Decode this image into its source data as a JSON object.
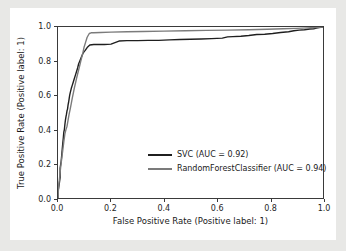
{
  "figure": {
    "background_color": "#ffffff",
    "outer_background_color": "#e8e8e6"
  },
  "chart_data": {
    "type": "line",
    "title": "",
    "xlabel": "False Positive Rate (Positive label: 1)",
    "ylabel": "True Positive Rate (Positive label: 1)",
    "xlim": [
      0.0,
      1.0
    ],
    "ylim": [
      0.0,
      1.0
    ],
    "grid": false,
    "legend_position": "lower right",
    "xticks": [
      0.0,
      0.2,
      0.4,
      0.6,
      0.8,
      1.0
    ],
    "xticklabels": [
      "0.0",
      "0.2",
      "0.4",
      "0.6",
      "0.8",
      "1.0"
    ],
    "yticks": [
      0.0,
      0.2,
      0.4,
      0.6,
      0.8,
      1.0
    ],
    "yticklabels": [
      "0.0",
      "0.2",
      "0.4",
      "0.6",
      "0.8",
      "1.0"
    ],
    "series": [
      {
        "name": "SVC (AUC = 0.92)",
        "label": "SVC",
        "auc": 0.92,
        "color": "#1f1f1f",
        "linewidth": 1.4,
        "x": [
          0.0,
          0.0,
          0.004,
          0.008,
          0.008,
          0.012,
          0.014,
          0.016,
          0.018,
          0.02,
          0.022,
          0.024,
          0.026,
          0.028,
          0.03,
          0.032,
          0.034,
          0.036,
          0.038,
          0.04,
          0.042,
          0.044,
          0.046,
          0.05,
          0.054,
          0.058,
          0.062,
          0.066,
          0.07,
          0.074,
          0.078,
          0.082,
          0.086,
          0.09,
          0.094,
          0.098,
          0.102,
          0.11,
          0.12,
          0.135,
          0.15,
          0.175,
          0.2,
          0.23,
          0.26,
          0.3,
          0.34,
          0.38,
          0.42,
          0.46,
          0.5,
          0.54,
          0.58,
          0.62,
          0.64,
          0.66,
          0.69,
          0.72,
          0.75,
          0.78,
          0.81,
          0.84,
          0.87,
          0.89,
          0.91,
          0.93,
          0.95,
          0.965,
          0.975,
          0.985,
          0.992,
          1.0
        ],
        "y": [
          0.0,
          0.035,
          0.075,
          0.12,
          0.175,
          0.215,
          0.25,
          0.285,
          0.32,
          0.35,
          0.385,
          0.4,
          0.43,
          0.455,
          0.475,
          0.49,
          0.51,
          0.52,
          0.545,
          0.56,
          0.58,
          0.6,
          0.615,
          0.64,
          0.66,
          0.68,
          0.7,
          0.72,
          0.74,
          0.76,
          0.785,
          0.8,
          0.815,
          0.83,
          0.845,
          0.855,
          0.862,
          0.88,
          0.895,
          0.898,
          0.898,
          0.898,
          0.9,
          0.918,
          0.92,
          0.92,
          0.922,
          0.922,
          0.925,
          0.927,
          0.928,
          0.93,
          0.932,
          0.935,
          0.942,
          0.944,
          0.946,
          0.95,
          0.956,
          0.958,
          0.962,
          0.968,
          0.972,
          0.978,
          0.982,
          0.984,
          0.988,
          0.99,
          0.994,
          0.996,
          0.998,
          1.0
        ]
      },
      {
        "name": "RandomForestClassifier (AUC = 0.94)",
        "label": "RandomForestClassifier",
        "auc": 0.94,
        "color": "#7b7b7b",
        "linewidth": 1.4,
        "x": [
          0.0,
          0.002,
          0.006,
          0.01,
          0.014,
          0.018,
          0.022,
          0.026,
          0.03,
          0.034,
          0.038,
          0.042,
          0.046,
          0.05,
          0.054,
          0.058,
          0.062,
          0.066,
          0.07,
          0.074,
          0.078,
          0.082,
          0.086,
          0.09,
          0.094,
          0.098,
          0.104,
          0.11,
          0.118,
          0.125,
          0.135,
          0.16,
          0.2,
          0.26,
          0.32,
          0.4,
          0.48,
          0.56,
          0.64,
          0.72,
          0.79,
          0.85,
          0.9,
          0.94,
          0.97,
          1.0
        ],
        "y": [
          0.0,
          0.06,
          0.12,
          0.18,
          0.23,
          0.28,
          0.33,
          0.375,
          0.4,
          0.42,
          0.455,
          0.49,
          0.52,
          0.552,
          0.585,
          0.615,
          0.645,
          0.672,
          0.7,
          0.725,
          0.75,
          0.775,
          0.8,
          0.825,
          0.85,
          0.88,
          0.91,
          0.94,
          0.962,
          0.966,
          0.966,
          0.968,
          0.97,
          0.972,
          0.974,
          0.976,
          0.978,
          0.98,
          0.982,
          0.984,
          0.987,
          0.99,
          0.992,
          0.995,
          0.997,
          1.0
        ]
      }
    ]
  },
  "legend": {
    "entries": [
      {
        "label": "SVC (AUC = 0.92)",
        "color": "#1f1f1f"
      },
      {
        "label": "RandomForestClassifier (AUC = 0.94)",
        "color": "#7b7b7b"
      }
    ]
  }
}
